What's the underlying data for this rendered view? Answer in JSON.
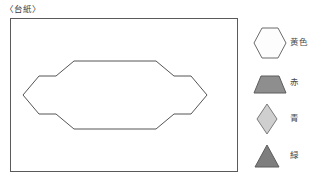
{
  "board": {
    "title": "〈台紙〉",
    "outline_color": "#5a5a5a",
    "background_color": "#ffffff",
    "shape": {
      "name": "elongated-hexagon-outline",
      "fill": "#ffffff",
      "stroke": "#555555"
    }
  },
  "legend": {
    "items": [
      {
        "shape": "hexagon",
        "icon_name": "hexagon-icon",
        "label": "黄色",
        "fill": "#fdfdfd",
        "stroke": "#6b6b6b"
      },
      {
        "shape": "trapezoid",
        "icon_name": "trapezoid-icon",
        "label": "赤",
        "fill": "#8e8e8e",
        "stroke": "#5d5d5d"
      },
      {
        "shape": "rhombus",
        "icon_name": "rhombus-icon",
        "label": "青",
        "fill": "#cfcfcf",
        "stroke": "#7a7a7a"
      },
      {
        "shape": "triangle",
        "icon_name": "triangle-icon",
        "label": "緑",
        "fill": "#7e7e7e",
        "stroke": "#5d5d5d"
      }
    ]
  }
}
